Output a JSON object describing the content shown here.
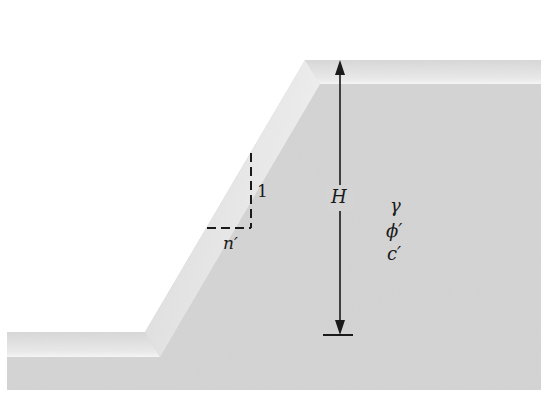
{
  "diagram": {
    "labels": {
      "height": "H",
      "rise": "1",
      "run": "n′",
      "unit_weight": "γ",
      "friction_angle": "ϕ′",
      "cohesion": "c′"
    },
    "colors": {
      "soil_fill": "#d6d6d6",
      "soil_bevel_light": "#f0f0f0",
      "soil_bevel_dark": "#c4c4c4",
      "line": "#1a1a1a",
      "background": "#ffffff"
    },
    "geometry": {
      "ground_left_x": 7,
      "ground_surface_y": 332,
      "toe_x": 145,
      "crest_x": 305,
      "crest_y": 60,
      "right_x": 541,
      "bottom_y": 390,
      "H_arrow_x": 340,
      "H_arrow_top_y": 60,
      "H_arrow_bottom_y": 335,
      "base_bar_x1": 323,
      "base_bar_x2": 353,
      "slope_triangle": {
        "vertical_x": 251,
        "top_y": 153,
        "corner_y": 228,
        "horizontal_left_x": 207
      }
    }
  }
}
